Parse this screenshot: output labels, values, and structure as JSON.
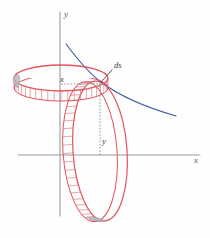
{
  "figure": {
    "background_color": "#fefefe",
    "width": 210,
    "height": 238
  },
  "axes": {
    "x_label": "x",
    "y_label": "y",
    "axis_color": "#9a9a9e",
    "origin": {
      "x": 60,
      "y": 155
    },
    "x_axis": {
      "x1": 18,
      "y1": 155,
      "x2": 200,
      "y2": 155
    },
    "y_axis": {
      "x1": 60,
      "y1": 12,
      "x2": 60,
      "y2": 216
    },
    "x_label_pos": {
      "x": 194,
      "y": 163
    },
    "y_label_pos": {
      "x": 64,
      "y": 17
    }
  },
  "curve": {
    "name": "generating-curve",
    "color": "#3f5f9e",
    "stroke_width": 1.1,
    "path": "M 66 44 C 78 60, 90 74, 101 82 C 118 95, 145 107, 176 116"
  },
  "rings": {
    "color": "#e2545e",
    "fill": "#ffffff",
    "band_color": "#e07a82",
    "horizontal": {
      "name": "horizontal-ring",
      "center": {
        "x": 61,
        "y": 78
      },
      "rx": 47,
      "ry": 13,
      "band_depth": 10,
      "segments": 22
    },
    "vertical": {
      "name": "vertical-ring",
      "center": {
        "x": 100,
        "y": 151
      },
      "rx": 27,
      "ry": 70,
      "band_depth": 10,
      "segments": 26,
      "rotation": -4
    }
  },
  "annotations": {
    "ds": {
      "label": "ds",
      "text_pos": {
        "x": 114,
        "y": 68
      },
      "leader": {
        "x1": 112,
        "y1": 70,
        "x2": 101,
        "y2": 82
      },
      "leader_color": "#3d3d44"
    },
    "x_measure": {
      "label": "x",
      "text_pos": {
        "x": 60,
        "y": 82
      },
      "dotted_line": {
        "x1": 61,
        "y1": 84,
        "x2": 100,
        "y2": 84
      },
      "dotted_color": "#7a9a9a"
    },
    "y_measure": {
      "label": "y",
      "text_pos": {
        "x": 102,
        "y": 144
      },
      "dotted_line": {
        "x1": 100,
        "y1": 83,
        "x2": 100,
        "y2": 155
      },
      "dotted_color": "#7a9a9a"
    },
    "intersection_point": {
      "x": 100,
      "y": 82
    }
  }
}
